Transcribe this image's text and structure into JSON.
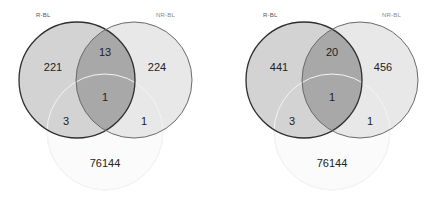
{
  "colors": {
    "set_a_fill": "#cfcfcf",
    "set_b_fill": "#e6e6e6",
    "overlap_fill": "#a8a8a8",
    "set_c_fill": "#fbfbfb",
    "set_a_stroke": "#2f2f2f",
    "set_b_stroke": "#6a6a6a",
    "set_c_stroke": "#ececec"
  },
  "diagrams": [
    {
      "set_labels": {
        "a": "R-BL",
        "b": "NR-BL",
        "c": ""
      },
      "regions": {
        "a_only": "221",
        "b_only": "224",
        "a_b_only": "13",
        "a_b_c": "1",
        "a_c_only": "3",
        "b_c_only": "1",
        "c_only": "76144"
      }
    },
    {
      "set_labels": {
        "a": "R-BL",
        "b": "NR-BL",
        "c": ""
      },
      "regions": {
        "a_only": "441",
        "b_only": "456",
        "a_b_only": "20",
        "a_b_c": "1",
        "a_c_only": "3",
        "b_c_only": "1",
        "c_only": "76144"
      }
    }
  ]
}
